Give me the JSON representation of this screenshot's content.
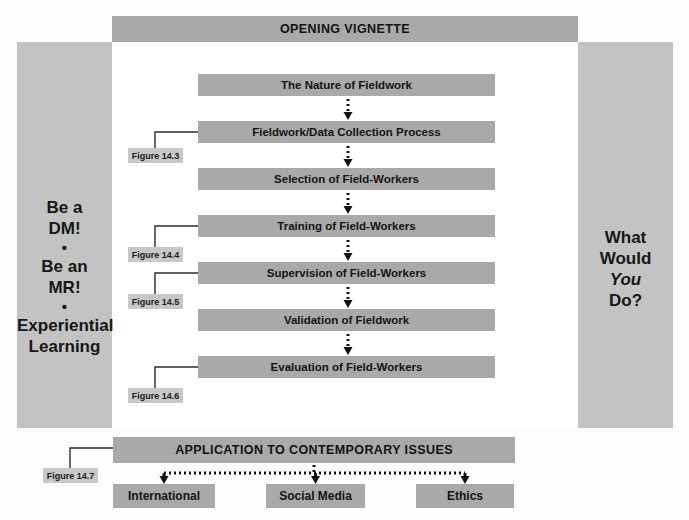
{
  "header": {
    "opening_vignette": "OPENING VIGNETTE",
    "application": "APPLICATION TO CONTEMPORARY ISSUES"
  },
  "sidebar_left": {
    "line1": "Be a",
    "line2": "DM!",
    "bullet1": "•",
    "line3": "Be an",
    "line4": "MR!",
    "bullet2": "•",
    "line5": "Experiential",
    "line6": "Learning"
  },
  "sidebar_right": {
    "line1": "What",
    "line2": "Would",
    "line3_italic": "You",
    "line4": "Do?"
  },
  "flow": {
    "boxes": [
      {
        "label": "The Nature of Fieldwork",
        "top": 74
      },
      {
        "label": "Fieldwork/Data Collection Process",
        "top": 121
      },
      {
        "label": "Selection of Field-Workers",
        "top": 168
      },
      {
        "label": "Training of Field-Workers",
        "top": 215
      },
      {
        "label": "Supervision of Field-Workers",
        "top": 262
      },
      {
        "label": "Validation of Fieldwork",
        "top": 309
      },
      {
        "label": "Evaluation of Field-Workers",
        "top": 356
      }
    ]
  },
  "leaves": [
    {
      "label": "International",
      "left": 113,
      "width": 102
    },
    {
      "label": "Social Media",
      "left": 266,
      "width": 99
    },
    {
      "label": "Ethics",
      "left": 416,
      "width": 98
    }
  ],
  "figure_callouts": [
    {
      "label": "Figure 14.3",
      "left": 128,
      "top": 148,
      "width": 55
    },
    {
      "label": "Figure 14.4",
      "left": 128,
      "top": 247,
      "width": 55
    },
    {
      "label": "Figure 14.5",
      "left": 128,
      "top": 294,
      "width": 55
    },
    {
      "label": "Figure 14.6",
      "left": 128,
      "top": 388,
      "width": 55
    },
    {
      "label": "Figure 14.7",
      "left": 43,
      "top": 468,
      "width": 55
    }
  ],
  "colors": {
    "box_gray": "#a9a9a9",
    "panel_gray": "#c3c3c3",
    "callout_gray": "#c8c8c8",
    "text_dark": "#141414",
    "connector": "#2b2b2b",
    "arrow": "#121212"
  }
}
